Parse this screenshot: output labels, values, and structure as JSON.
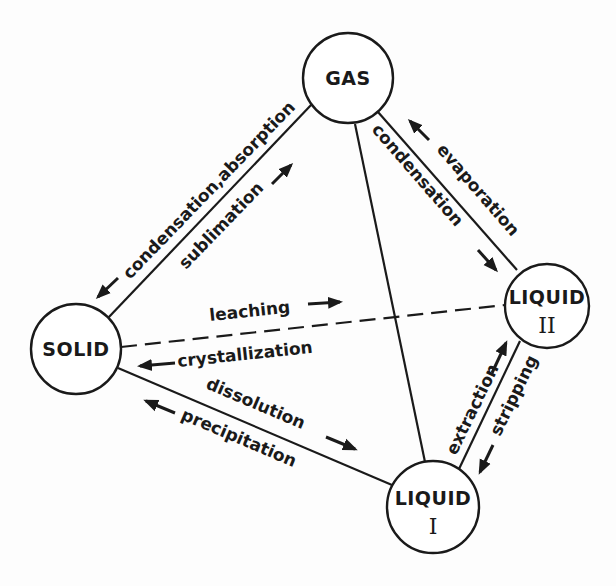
{
  "diagram": {
    "type": "phase-transfer-tetrahedron",
    "nodes": [
      {
        "id": "gas",
        "label": "GAS",
        "sub": ""
      },
      {
        "id": "solid",
        "label": "SOLID",
        "sub": ""
      },
      {
        "id": "liquid1",
        "label": "LIQUID",
        "sub": "I"
      },
      {
        "id": "liquid2",
        "label": "LIQUID",
        "sub": "II"
      }
    ],
    "edges": [
      {
        "from": "gas",
        "to": "solid",
        "labels": [
          "condensation,absorption",
          "sublimation"
        ],
        "style": "solid"
      },
      {
        "from": "gas",
        "to": "liquid2",
        "labels": [
          "evaporation",
          "condensation"
        ],
        "style": "solid"
      },
      {
        "from": "gas",
        "to": "liquid1",
        "labels": [],
        "style": "solid"
      },
      {
        "from": "solid",
        "to": "liquid2",
        "labels": [
          "leaching",
          "crystallization"
        ],
        "style": "dashed"
      },
      {
        "from": "solid",
        "to": "liquid1",
        "labels": [
          "dissolution",
          "precipitation"
        ],
        "style": "solid"
      },
      {
        "from": "liquid1",
        "to": "liquid2",
        "labels": [
          "extraction",
          "stripping"
        ],
        "style": "solid"
      }
    ],
    "labels": {
      "gas_solid_upper": "condensation,absorption",
      "gas_solid_lower": "sublimation",
      "gas_liq2_upper": "evaporation",
      "gas_liq2_lower": "condensation",
      "solid_liq2_upper": "leaching",
      "solid_liq2_lower": "crystallization",
      "solid_liq1_upper": "dissolution",
      "solid_liq1_lower": "precipitation",
      "liq1_liq2_left": "extraction",
      "liq1_liq2_right": "stripping"
    }
  }
}
